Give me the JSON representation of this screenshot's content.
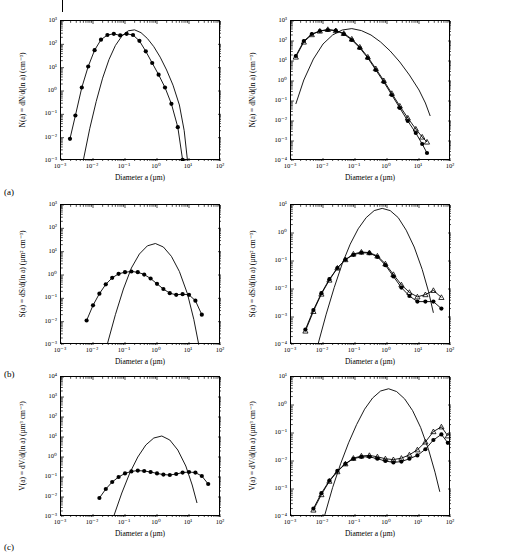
{
  "figure": {
    "row_labels": [
      "(a)",
      "(b)",
      "(c)"
    ]
  },
  "chart_data": [
    {
      "id": "panel-a-left",
      "type": "line",
      "title": "",
      "xlabel": "Diameter a (µm)",
      "ylabel": "N(a) = dN/d(ln a) (cm⁻³)",
      "xlim": [
        -3,
        2
      ],
      "ylim": [
        -3,
        3
      ],
      "xticks": [
        "10⁻³",
        "10⁻²",
        "10⁻¹",
        "10⁰",
        "10¹",
        "10²"
      ],
      "yticks": [
        "10⁻³",
        "10⁻²",
        "10⁻¹",
        "10⁰",
        "10¹",
        "10²",
        "10³"
      ],
      "grid": false,
      "legend": "none",
      "series": [
        {
          "name": "model",
          "marker": "none",
          "x": [
            -2.3,
            -2.1,
            -1.9,
            -1.7,
            -1.5,
            -1.3,
            -1.1,
            -0.9,
            -0.7,
            -0.5,
            -0.3,
            -0.1,
            0.1,
            0.3,
            0.5,
            0.7,
            0.85,
            0.95
          ],
          "y": [
            -2.95,
            -1.6,
            -0.45,
            0.55,
            1.35,
            1.95,
            2.35,
            2.58,
            2.62,
            2.5,
            2.25,
            1.9,
            1.45,
            0.9,
            0.25,
            -0.6,
            -1.7,
            -2.95
          ]
        },
        {
          "name": "measured",
          "marker": "circle",
          "x": [
            -2.72,
            -2.55,
            -2.35,
            -2.15,
            -1.95,
            -1.75,
            -1.55,
            -1.35,
            -1.15,
            -0.95,
            -0.75,
            -0.55,
            -0.35,
            -0.15,
            0.05,
            0.25,
            0.45,
            0.65,
            0.8
          ],
          "y": [
            -2.05,
            -1.05,
            0.15,
            1.05,
            1.75,
            2.2,
            2.4,
            2.45,
            2.38,
            2.45,
            2.4,
            2.15,
            1.7,
            1.2,
            0.7,
            0.15,
            -0.55,
            -1.55,
            -2.95
          ]
        }
      ]
    },
    {
      "id": "panel-a-right",
      "type": "line",
      "title": "",
      "xlabel": "Diameter a (µm)",
      "ylabel": "N(a) = dN/d(ln a) (cm⁻³)",
      "xlim": [
        -3,
        2
      ],
      "ylim": [
        -4,
        3
      ],
      "xticks": [
        "10⁻³",
        "10⁻²",
        "10⁻¹",
        "10⁰",
        "10¹",
        "10²"
      ],
      "yticks": [
        "10⁻⁴",
        "10⁻³",
        "10⁻²",
        "10⁻¹",
        "10⁰",
        "10¹",
        "10²",
        "10³"
      ],
      "grid": false,
      "legend": "none",
      "series": [
        {
          "name": "model",
          "marker": "none",
          "x": [
            -2.85,
            -2.6,
            -2.3,
            -2.0,
            -1.7,
            -1.4,
            -1.1,
            -0.8,
            -0.5,
            -0.2,
            0.1,
            0.4,
            0.7,
            1.0,
            1.2,
            1.35
          ],
          "y": [
            -1.15,
            0.05,
            1.1,
            1.85,
            2.3,
            2.55,
            2.62,
            2.52,
            2.3,
            1.95,
            1.5,
            0.95,
            0.3,
            -0.45,
            -1.1,
            -1.75
          ]
        },
        {
          "name": "measured-circles",
          "marker": "circle",
          "x": [
            -2.85,
            -2.6,
            -2.35,
            -2.1,
            -1.85,
            -1.6,
            -1.35,
            -1.1,
            -0.85,
            -0.6,
            -0.35,
            -0.1,
            0.15,
            0.4,
            0.65,
            0.9,
            1.1,
            1.25
          ],
          "y": [
            1.25,
            2.0,
            2.35,
            2.5,
            2.55,
            2.52,
            2.35,
            2.05,
            1.65,
            1.15,
            0.55,
            -0.05,
            -0.7,
            -1.35,
            -2.0,
            -2.6,
            -3.15,
            -3.6
          ]
        },
        {
          "name": "measured-triangles",
          "marker": "triangle",
          "x": [
            -2.85,
            -2.6,
            -2.35,
            -2.1,
            -1.85,
            -1.6,
            -1.35,
            -1.1,
            -0.85,
            -0.6,
            -0.35,
            -0.1,
            0.15,
            0.4,
            0.65,
            0.9,
            1.1,
            1.25
          ],
          "y": [
            1.2,
            1.95,
            2.32,
            2.5,
            2.58,
            2.52,
            2.38,
            2.1,
            1.7,
            1.2,
            0.62,
            0.02,
            -0.62,
            -1.25,
            -1.85,
            -2.4,
            -2.8,
            -3.05
          ]
        }
      ]
    },
    {
      "id": "panel-b-left",
      "type": "line",
      "title": "",
      "xlabel": "Diameter a (µm)",
      "ylabel": "S(a) = dS/d(ln a) (µm² cm⁻³)",
      "xlim": [
        -3,
        2
      ],
      "ylim": [
        -3,
        3
      ],
      "xticks": [
        "10⁻³",
        "10⁻²",
        "10⁻¹",
        "10⁰",
        "10¹",
        "10²"
      ],
      "yticks": [
        "10⁻³",
        "10⁻²",
        "10⁻¹",
        "10⁰",
        "10¹",
        "10²",
        "10³"
      ],
      "grid": false,
      "legend": "none",
      "series": [
        {
          "name": "model",
          "marker": "none",
          "x": [
            -1.55,
            -1.3,
            -1.05,
            -0.8,
            -0.55,
            -0.3,
            -0.05,
            0.2,
            0.45,
            0.7,
            0.95,
            1.15,
            1.3
          ],
          "y": [
            -2.95,
            -1.7,
            -0.6,
            0.3,
            0.9,
            1.25,
            1.35,
            1.2,
            0.8,
            0.15,
            -0.8,
            -1.9,
            -2.95
          ]
        },
        {
          "name": "measured",
          "marker": "circle",
          "x": [
            -2.2,
            -2.0,
            -1.8,
            -1.6,
            -1.4,
            -1.2,
            -1.0,
            -0.8,
            -0.6,
            -0.4,
            -0.2,
            0.0,
            0.2,
            0.4,
            0.6,
            0.8,
            1.0,
            1.2,
            1.4
          ],
          "y": [
            -1.95,
            -1.3,
            -0.8,
            -0.4,
            -0.12,
            0.05,
            0.12,
            0.15,
            0.12,
            0.02,
            -0.15,
            -0.38,
            -0.6,
            -0.78,
            -0.85,
            -0.82,
            -0.85,
            -1.1,
            -1.7
          ]
        }
      ]
    },
    {
      "id": "panel-b-right",
      "type": "line",
      "title": "",
      "xlabel": "Diameter a (µm)",
      "ylabel": "S(a) = dS/d(ln a) (µm² cm⁻³)",
      "xlim": [
        -3,
        2
      ],
      "ylim": [
        -4,
        1
      ],
      "xticks": [
        "10⁻³",
        "10⁻²",
        "10⁻¹",
        "10⁰",
        "10¹",
        "10²"
      ],
      "yticks": [
        "10⁻⁴",
        "10⁻³",
        "10⁻²",
        "10⁻¹",
        "10⁰",
        "10¹"
      ],
      "grid": false,
      "legend": "none",
      "series": [
        {
          "name": "model",
          "marker": "none",
          "x": [
            -2.15,
            -1.9,
            -1.65,
            -1.4,
            -1.15,
            -0.9,
            -0.65,
            -0.4,
            -0.15,
            0.1,
            0.35,
            0.6,
            0.85,
            1.1,
            1.3,
            1.45
          ],
          "y": [
            -3.95,
            -2.9,
            -1.95,
            -1.1,
            -0.4,
            0.15,
            0.55,
            0.8,
            0.88,
            0.8,
            0.55,
            0.1,
            -0.5,
            -1.3,
            -2.1,
            -2.85
          ]
        },
        {
          "name": "measured-circles",
          "marker": "circle",
          "x": [
            -2.55,
            -2.3,
            -2.05,
            -1.8,
            -1.55,
            -1.3,
            -1.05,
            -0.8,
            -0.55,
            -0.3,
            -0.05,
            0.2,
            0.45,
            0.7,
            0.95,
            1.2,
            1.45,
            1.7
          ],
          "y": [
            -3.45,
            -2.75,
            -2.15,
            -1.65,
            -1.25,
            -0.95,
            -0.78,
            -0.7,
            -0.72,
            -0.85,
            -1.15,
            -1.55,
            -1.95,
            -2.25,
            -2.45,
            -2.45,
            -2.45,
            -2.7
          ]
        },
        {
          "name": "measured-triangles",
          "marker": "triangle",
          "x": [
            -2.55,
            -2.3,
            -2.05,
            -1.8,
            -1.55,
            -1.3,
            -1.05,
            -0.8,
            -0.55,
            -0.3,
            -0.05,
            0.2,
            0.45,
            0.7,
            0.95,
            1.2,
            1.45,
            1.7
          ],
          "y": [
            -3.5,
            -2.8,
            -2.18,
            -1.68,
            -1.25,
            -0.95,
            -0.75,
            -0.68,
            -0.7,
            -0.82,
            -1.1,
            -1.48,
            -1.85,
            -2.12,
            -2.28,
            -2.2,
            -2.05,
            -2.3
          ]
        }
      ]
    },
    {
      "id": "panel-c-left",
      "type": "line",
      "title": "",
      "xlabel": "Diameter a (µm)",
      "ylabel": "V(a) = dV/d(ln a) (µm³ cm⁻³)",
      "xlim": [
        -3,
        2
      ],
      "ylim": [
        -3,
        4
      ],
      "xticks": [
        "10⁻³",
        "10⁻²",
        "10⁻¹",
        "10⁰",
        "10¹",
        "10²"
      ],
      "yticks": [
        "10⁻³",
        "10⁻²",
        "10⁻¹",
        "10⁰",
        "10¹",
        "10²",
        "10³",
        "10⁴"
      ],
      "grid": false,
      "legend": "none",
      "series": [
        {
          "name": "model",
          "marker": "none",
          "x": [
            -1.35,
            -1.1,
            -0.85,
            -0.6,
            -0.35,
            -0.1,
            0.15,
            0.4,
            0.65,
            0.9,
            1.1,
            1.25
          ],
          "y": [
            -2.95,
            -1.8,
            -0.8,
            0.0,
            0.6,
            0.95,
            1.05,
            0.85,
            0.35,
            -0.45,
            -1.4,
            -2.3
          ]
        },
        {
          "name": "measured",
          "marker": "circle",
          "x": [
            -1.8,
            -1.6,
            -1.4,
            -1.2,
            -1.0,
            -0.8,
            -0.6,
            -0.4,
            -0.2,
            0.0,
            0.2,
            0.4,
            0.6,
            0.8,
            1.0,
            1.2,
            1.4,
            1.6
          ],
          "y": [
            -2.05,
            -1.6,
            -1.25,
            -1.0,
            -0.82,
            -0.72,
            -0.68,
            -0.7,
            -0.75,
            -0.82,
            -0.88,
            -0.9,
            -0.85,
            -0.78,
            -0.75,
            -0.78,
            -0.95,
            -1.35
          ]
        }
      ]
    },
    {
      "id": "panel-c-right",
      "type": "line",
      "title": "",
      "xlabel": "Diameter a (µm)",
      "ylabel": "V(a) = dV/d(ln a) (µm³ cm⁻³)",
      "xlim": [
        -3,
        2
      ],
      "ylim": [
        -4,
        1
      ],
      "xticks": [
        "10⁻³",
        "10⁻²",
        "10⁻¹",
        "10⁰",
        "10¹",
        "10²"
      ],
      "yticks": [
        "10⁻⁴",
        "10⁻³",
        "10⁻²",
        "10⁻¹",
        "10⁰",
        "10¹"
      ],
      "grid": false,
      "legend": "none",
      "series": [
        {
          "name": "model",
          "marker": "none",
          "x": [
            -1.95,
            -1.7,
            -1.45,
            -1.2,
            -0.95,
            -0.7,
            -0.45,
            -0.2,
            0.05,
            0.3,
            0.55,
            0.8,
            1.05,
            1.3,
            1.5,
            1.65
          ],
          "y": [
            -3.95,
            -2.95,
            -2.1,
            -1.35,
            -0.7,
            -0.15,
            0.25,
            0.5,
            0.58,
            0.48,
            0.22,
            -0.2,
            -0.8,
            -1.6,
            -2.4,
            -3.1
          ]
        },
        {
          "name": "measured-circles",
          "marker": "circle",
          "x": [
            -2.3,
            -2.05,
            -1.8,
            -1.55,
            -1.3,
            -1.05,
            -0.8,
            -0.55,
            -0.3,
            -0.05,
            0.2,
            0.45,
            0.7,
            0.95,
            1.2,
            1.45,
            1.7,
            1.9
          ],
          "y": [
            -3.7,
            -3.15,
            -2.7,
            -2.35,
            -2.1,
            -1.92,
            -1.85,
            -1.85,
            -1.92,
            -2.0,
            -2.05,
            -2.02,
            -1.92,
            -1.8,
            -1.58,
            -1.25,
            -1.05,
            -1.35
          ]
        },
        {
          "name": "measured-triangles",
          "marker": "triangle",
          "x": [
            -2.3,
            -2.05,
            -1.8,
            -1.55,
            -1.3,
            -1.05,
            -0.8,
            -0.55,
            -0.3,
            -0.05,
            0.2,
            0.45,
            0.7,
            0.95,
            1.2,
            1.45,
            1.7,
            1.9
          ],
          "y": [
            -3.75,
            -3.2,
            -2.72,
            -2.38,
            -2.1,
            -1.9,
            -1.82,
            -1.8,
            -1.85,
            -1.92,
            -1.95,
            -1.9,
            -1.78,
            -1.6,
            -1.32,
            -0.95,
            -0.78,
            -1.1
          ]
        }
      ]
    }
  ]
}
